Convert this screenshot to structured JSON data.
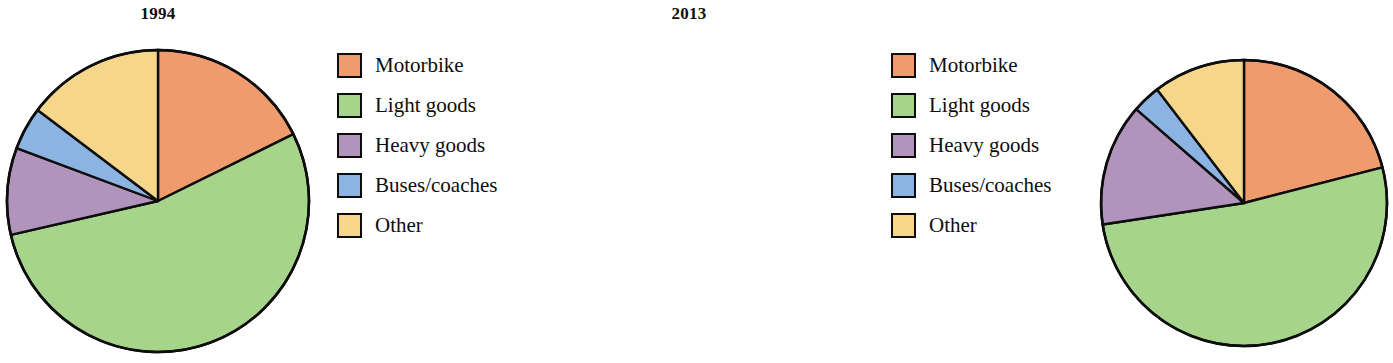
{
  "figure": {
    "background": "#ffffff",
    "outline_color": "#0d0d0d"
  },
  "palette": {
    "motorbike": "#ef9b6e",
    "light_goods": "#a6d48b",
    "heavy_goods": "#b094bb",
    "buses_coaches": "#8cb4e2",
    "other": "#f5d68b"
  },
  "legend": {
    "items": [
      {
        "label": "Motorbike",
        "color": "#ef9b6e"
      },
      {
        "label": "Light goods",
        "color": "#a6d48b"
      },
      {
        "label": "Heavy goods",
        "color": "#b094bb"
      },
      {
        "label": "Buses/coaches",
        "color": "#8cb4e2"
      },
      {
        "label": "Other",
        "color": "#f5d68b"
      }
    ]
  },
  "panels": [
    {
      "title": "1994"
    },
    {
      "title": "2013"
    }
  ],
  "chart_data": [
    {
      "type": "pie",
      "title": "1994",
      "categories": [
        "Motorbike",
        "Light goods",
        "Heavy goods",
        "Buses/coaches",
        "Other"
      ],
      "values": [
        17.7,
        53.7,
        9.3,
        4.6,
        14.7
      ],
      "units": "percent",
      "start_angle_deg": 0,
      "direction": "clockwise",
      "colors": [
        "#ef9b6e",
        "#a6d48b",
        "#b094bb",
        "#8cb4e2",
        "#f5d68b"
      ],
      "legend_position": "right",
      "grid": false,
      "xlabel": "",
      "ylabel": ""
    },
    {
      "type": "pie",
      "title": "2013",
      "categories": [
        "Motorbike",
        "Light goods",
        "Heavy goods",
        "Buses/coaches",
        "Other"
      ],
      "values": [
        21.0,
        51.6,
        13.8,
        3.2,
        10.4
      ],
      "units": "percent",
      "start_angle_deg": 0,
      "direction": "clockwise",
      "colors": [
        "#ef9b6e",
        "#a6d48b",
        "#b094bb",
        "#8cb4e2",
        "#f5d68b"
      ],
      "legend_position": "right",
      "grid": false,
      "xlabel": "",
      "ylabel": ""
    }
  ],
  "geometry": [
    {
      "cx": 158,
      "cy": 201,
      "r": 151,
      "left": 0,
      "top": 0,
      "size": 360
    },
    {
      "cx": 182,
      "cy": 203,
      "r": 143,
      "left": 531,
      "top": 0,
      "size": 360
    }
  ],
  "legend_geometry": [
    {
      "left": 337,
      "top": 45
    },
    {
      "left": 891,
      "top": 45
    }
  ]
}
